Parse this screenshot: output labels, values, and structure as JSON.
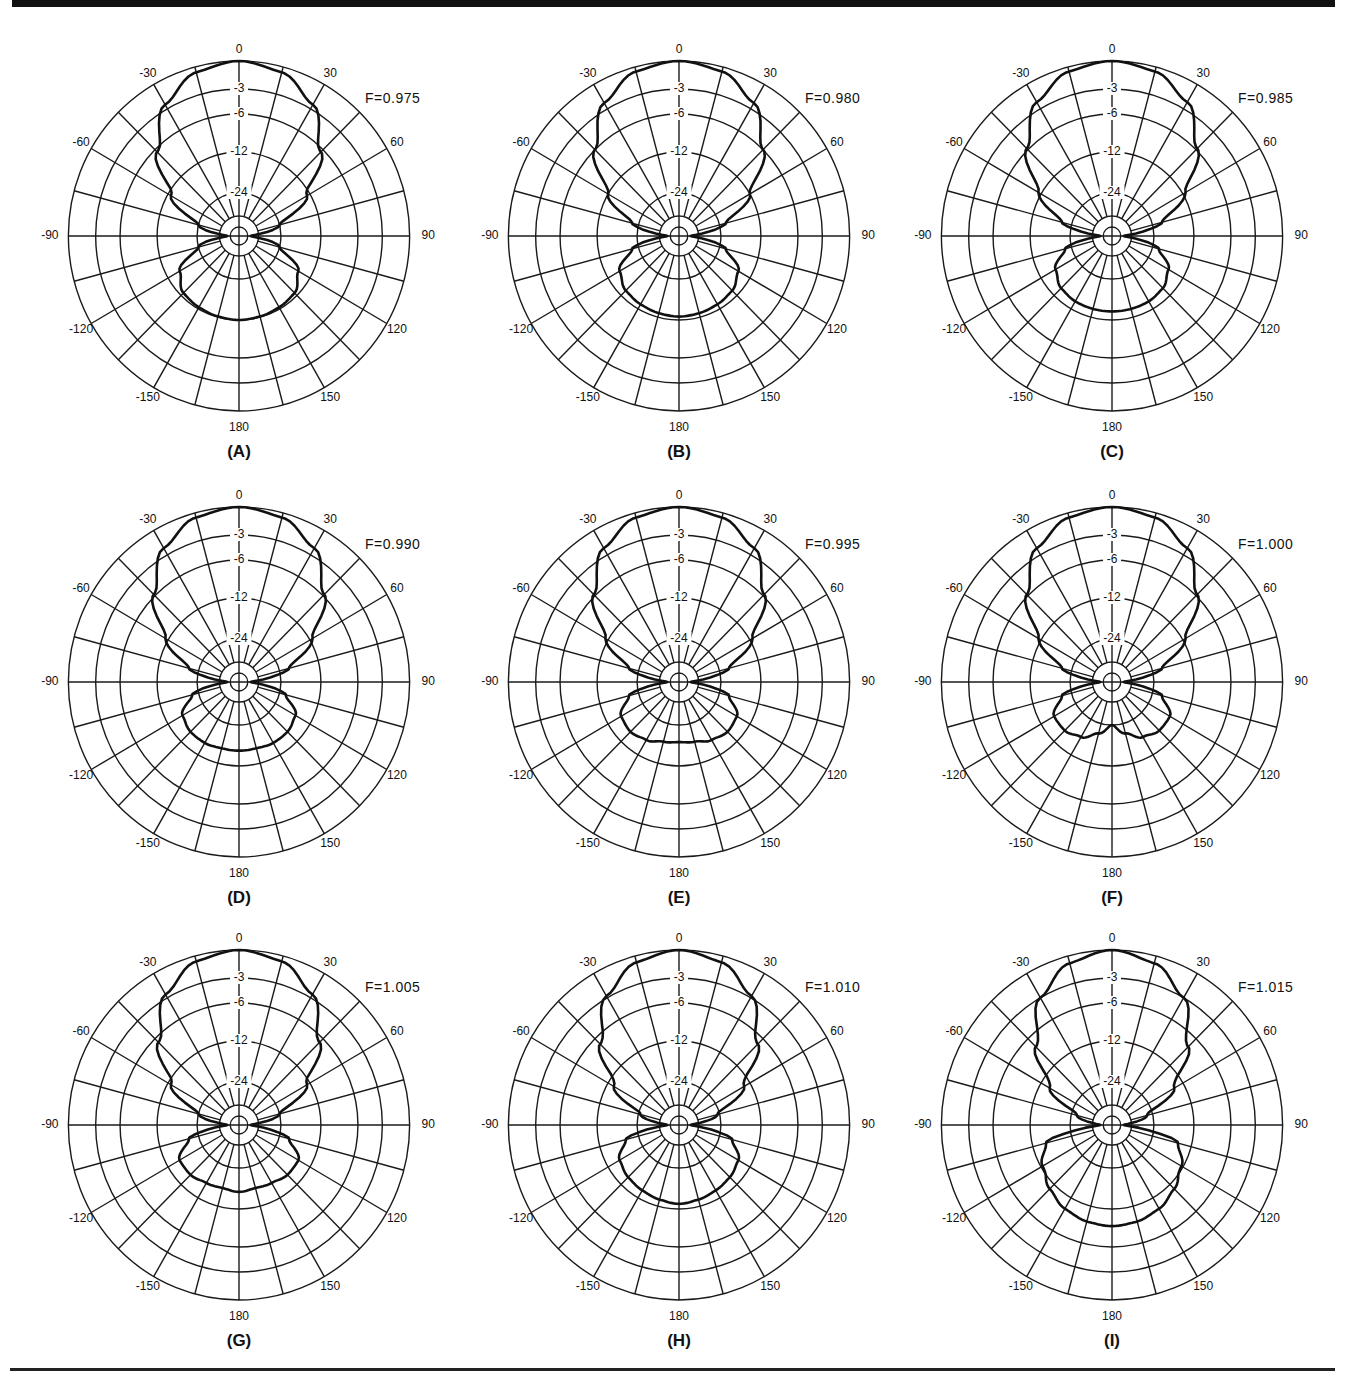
{
  "figure": {
    "panels": [
      "A",
      "B",
      "C",
      "D",
      "E",
      "F",
      "G",
      "H",
      "I"
    ]
  },
  "chart_data": [
    {
      "type": "polar",
      "panel": "(A)",
      "annotation": "F=0.975",
      "angle_ticks": [
        0,
        30,
        60,
        90,
        120,
        150,
        180,
        -150,
        -120,
        -90,
        -60,
        -30
      ],
      "radial_ticks_db": [
        0,
        -3,
        -6,
        -12,
        -24
      ],
      "grid_spokes_deg": 15,
      "front_lobe": {
        "angles": [
          0,
          15,
          30,
          45,
          60,
          75,
          90
        ],
        "db": [
          0,
          -0.6,
          -2.5,
          -6.5,
          -13,
          -24,
          -40
        ]
      },
      "back_lobe": {
        "angles": [
          90,
          105,
          120,
          135,
          150,
          165,
          180
        ],
        "db": [
          -40,
          -24,
          -16,
          -13,
          -12.5,
          -12.2,
          -12
        ]
      }
    },
    {
      "type": "polar",
      "panel": "(B)",
      "annotation": "F=0.980",
      "angle_ticks": [
        0,
        30,
        60,
        90,
        120,
        150,
        180,
        -150,
        -120,
        -90,
        -60,
        -30
      ],
      "radial_ticks_db": [
        0,
        -3,
        -6,
        -12,
        -24
      ],
      "grid_spokes_deg": 15,
      "front_lobe": {
        "angles": [
          0,
          15,
          30,
          45,
          60,
          75,
          90
        ],
        "db": [
          0,
          -0.5,
          -2.3,
          -6,
          -12,
          -22,
          -40
        ]
      },
      "back_lobe": {
        "angles": [
          90,
          105,
          120,
          135,
          150,
          165,
          180
        ],
        "db": [
          -40,
          -22,
          -16,
          -14,
          -13.5,
          -13.2,
          -13
        ]
      }
    },
    {
      "type": "polar",
      "panel": "(C)",
      "annotation": "F=0.985",
      "angle_ticks": [
        0,
        30,
        60,
        90,
        120,
        150,
        180,
        -150,
        -120,
        -90,
        -60,
        -30
      ],
      "radial_ticks_db": [
        0,
        -3,
        -6,
        -12,
        -24
      ],
      "grid_spokes_deg": 15,
      "front_lobe": {
        "angles": [
          0,
          15,
          30,
          45,
          60,
          75,
          90
        ],
        "db": [
          0,
          -0.5,
          -2.2,
          -5.8,
          -11.5,
          -21,
          -40
        ]
      },
      "back_lobe": {
        "angles": [
          90,
          105,
          120,
          135,
          150,
          165,
          180
        ],
        "db": [
          -40,
          -22,
          -17,
          -15,
          -14.5,
          -14.5,
          -14.5
        ]
      }
    },
    {
      "type": "polar",
      "panel": "(D)",
      "annotation": "F=0.990",
      "angle_ticks": [
        0,
        30,
        60,
        90,
        120,
        150,
        180,
        -150,
        -120,
        -90,
        -60,
        -30
      ],
      "radial_ticks_db": [
        0,
        -3,
        -6,
        -12,
        -24
      ],
      "grid_spokes_deg": 15,
      "front_lobe": {
        "angles": [
          0,
          15,
          30,
          45,
          60,
          75,
          90
        ],
        "db": [
          0,
          -0.5,
          -2.2,
          -5.8,
          -11.5,
          -21,
          -40
        ]
      },
      "back_lobe": {
        "angles": [
          90,
          105,
          120,
          135,
          150,
          165,
          180
        ],
        "db": [
          -40,
          -22,
          -17,
          -16,
          -16,
          -16.5,
          -16.5
        ]
      }
    },
    {
      "type": "polar",
      "panel": "(E)",
      "annotation": "F=0.995",
      "angle_ticks": [
        0,
        30,
        60,
        90,
        120,
        150,
        180,
        -150,
        -120,
        -90,
        -60,
        -30
      ],
      "radial_ticks_db": [
        0,
        -3,
        -6,
        -12,
        -24
      ],
      "grid_spokes_deg": 15,
      "front_lobe": {
        "angles": [
          0,
          15,
          30,
          45,
          60,
          75,
          90
        ],
        "db": [
          0,
          -0.5,
          -2.2,
          -5.8,
          -11.5,
          -21,
          -40
        ]
      },
      "back_lobe": {
        "angles": [
          90,
          105,
          120,
          135,
          150,
          165,
          180
        ],
        "db": [
          -40,
          -21,
          -16.5,
          -16,
          -17,
          -18.5,
          -19
        ]
      }
    },
    {
      "type": "polar",
      "panel": "(F)",
      "annotation": "F=1.000",
      "angle_ticks": [
        0,
        30,
        60,
        90,
        120,
        150,
        180,
        -150,
        -120,
        -90,
        -60,
        -30
      ],
      "radial_ticks_db": [
        0,
        -3,
        -6,
        -12,
        -24
      ],
      "grid_spokes_deg": 15,
      "front_lobe": {
        "angles": [
          0,
          15,
          30,
          45,
          60,
          75,
          90
        ],
        "db": [
          0,
          -0.5,
          -2.2,
          -5.8,
          -11.5,
          -21,
          -40
        ]
      },
      "back_lobe": {
        "angles": [
          90,
          105,
          120,
          135,
          150,
          165,
          180
        ],
        "db": [
          -40,
          -21,
          -16.5,
          -16.5,
          -18,
          -21,
          -24
        ]
      }
    },
    {
      "type": "polar",
      "panel": "(G)",
      "annotation": "F=1.005",
      "angle_ticks": [
        0,
        30,
        60,
        90,
        120,
        150,
        180,
        -150,
        -120,
        -90,
        -60,
        -30
      ],
      "radial_ticks_db": [
        0,
        -3,
        -6,
        -12,
        -24
      ],
      "grid_spokes_deg": 15,
      "front_lobe": {
        "angles": [
          0,
          15,
          30,
          45,
          60,
          75,
          90
        ],
        "db": [
          0,
          -0.6,
          -2.6,
          -6.8,
          -13,
          -24,
          -40
        ]
      },
      "back_lobe": {
        "angles": [
          90,
          105,
          120,
          135,
          150,
          165,
          180
        ],
        "db": [
          -40,
          -21,
          -16,
          -16,
          -17,
          -17.5,
          -17
        ]
      }
    },
    {
      "type": "polar",
      "panel": "(H)",
      "annotation": "F=1.010",
      "angle_ticks": [
        0,
        30,
        60,
        90,
        120,
        150,
        180,
        -150,
        -120,
        -90,
        -60,
        -30
      ],
      "radial_ticks_db": [
        0,
        -3,
        -6,
        -12,
        -24
      ],
      "grid_spokes_deg": 15,
      "front_lobe": {
        "angles": [
          0,
          15,
          30,
          45,
          60,
          75,
          90
        ],
        "db": [
          0,
          -0.7,
          -2.8,
          -7.2,
          -14,
          -25,
          -40
        ]
      },
      "back_lobe": {
        "angles": [
          90,
          105,
          120,
          135,
          150,
          165,
          180
        ],
        "db": [
          -40,
          -20,
          -16,
          -15,
          -14.5,
          -14,
          -13.5
        ]
      }
    },
    {
      "type": "polar",
      "panel": "(I)",
      "annotation": "F=1.015",
      "angle_ticks": [
        0,
        30,
        60,
        90,
        120,
        150,
        180,
        -150,
        -120,
        -90,
        -60,
        -30
      ],
      "radial_ticks_db": [
        0,
        -3,
        -6,
        -12,
        -24
      ],
      "grid_spokes_deg": 15,
      "front_lobe": {
        "angles": [
          0,
          15,
          30,
          45,
          60,
          75,
          90
        ],
        "db": [
          0,
          -0.8,
          -3,
          -7.8,
          -15,
          -27,
          -40
        ]
      },
      "back_lobe": {
        "angles": [
          90,
          105,
          120,
          135,
          150,
          165,
          180
        ],
        "db": [
          -40,
          -16,
          -12.5,
          -11,
          -10,
          -9.5,
          -9.3
        ]
      }
    }
  ]
}
